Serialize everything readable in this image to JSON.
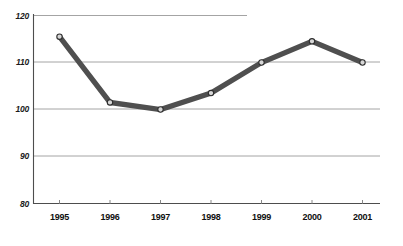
{
  "chart_data": {
    "type": "line",
    "title": "",
    "subtitle": "",
    "xlabel": "",
    "ylabel": "",
    "categories": [
      "1995",
      "1996",
      "1997",
      "1998",
      "1999",
      "2000",
      "2001"
    ],
    "values": [
      115.5,
      101.5,
      100,
      103.5,
      110,
      114.5,
      110
    ],
    "series": [
      {
        "name": "",
        "values": [
          115.5,
          101.5,
          100,
          103.5,
          110,
          114.5,
          110
        ]
      }
    ],
    "ylim": [
      80,
      120
    ],
    "yticks": [
      80,
      90,
      100,
      110,
      120
    ],
    "ytick_labels": [
      "80",
      "90",
      "100",
      "110",
      "120"
    ],
    "xtick_labels": [
      "1995",
      "1996",
      "1997",
      "1998",
      "1999",
      "2000",
      "2001"
    ],
    "grid": true,
    "grid_axis": "y",
    "legend": false,
    "legend_position": "none",
    "markers": "circle",
    "annotations": [],
    "colors": {
      "line": "#4f4f4f",
      "marker_fill": "#d7d7d7",
      "marker_stroke": "#2e2e2e",
      "gridline": "#9a9a9a",
      "axis": "#4d4d4d",
      "text": "#101010",
      "background": "#ffffff"
    }
  },
  "axes": {
    "y_ticks": [
      {
        "value": 120,
        "label": "120"
      },
      {
        "value": 110,
        "label": "110"
      },
      {
        "value": 100,
        "label": "100"
      },
      {
        "value": 90,
        "label": "90"
      },
      {
        "value": 80,
        "label": "80"
      }
    ],
    "x_ticks": [
      {
        "label": "1995"
      },
      {
        "label": "1996"
      },
      {
        "label": "1997"
      },
      {
        "label": "1998"
      },
      {
        "label": "1999"
      },
      {
        "label": "2000"
      },
      {
        "label": "2001"
      }
    ]
  }
}
